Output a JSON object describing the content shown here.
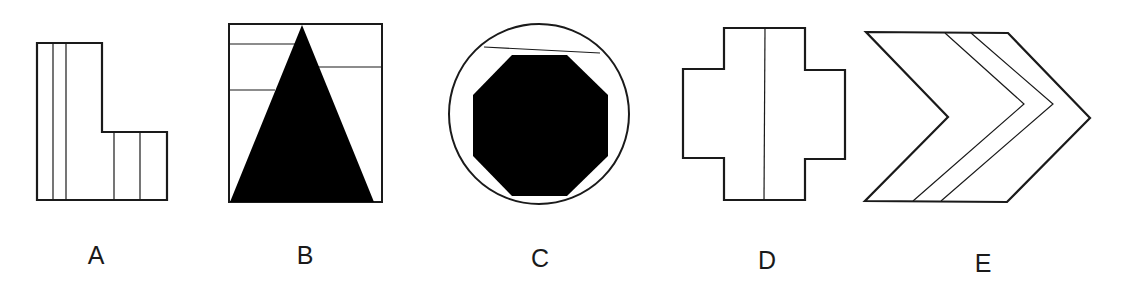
{
  "figures": [
    {
      "id": "A",
      "label": "A",
      "shape": "L-shape",
      "fill": "none",
      "inner_lines": "4 vertical"
    },
    {
      "id": "B",
      "label": "B",
      "shape": "square with filled triangle",
      "fill": "#000000",
      "inner_lines": "3 horizontal"
    },
    {
      "id": "C",
      "label": "C",
      "shape": "circle with filled octagon",
      "fill": "#000000",
      "inner_lines": "1 chord"
    },
    {
      "id": "D",
      "label": "D",
      "shape": "cross",
      "fill": "none",
      "inner_lines": "1 vertical"
    },
    {
      "id": "E",
      "label": "E",
      "shape": "chevron",
      "fill": "none",
      "inner_lines": "2 chevron"
    }
  ],
  "colors": {
    "stroke": "#1a1a1a",
    "fill": "#000000",
    "background": "#ffffff"
  }
}
